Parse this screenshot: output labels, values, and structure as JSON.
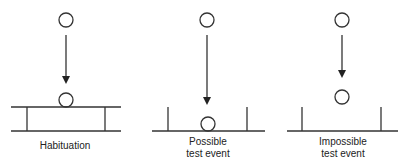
{
  "figure": {
    "colors": {
      "line": "#333333",
      "text": "#222222",
      "background": "#ffffff"
    },
    "panels": [
      {
        "id": "habituation",
        "label_lines": [
          "Habituation"
        ],
        "description": "Ball falls onto a solid surface supported between two walls (screen with table surface)"
      },
      {
        "id": "possible",
        "label_lines": [
          "Possible",
          "test event"
        ],
        "description": "Ball falls and lands on floor between two walls"
      },
      {
        "id": "impossible",
        "label_lines": [
          "Impossible",
          "test event"
        ],
        "description": "Ball falls and stops in mid-air above floor between two walls"
      }
    ]
  }
}
